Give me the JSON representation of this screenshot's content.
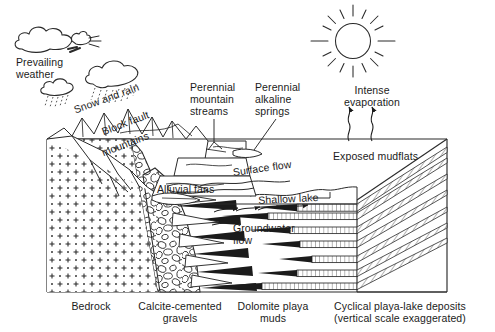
{
  "diagram": {
    "background_color": "#ffffff",
    "ink_color": "#1b1b1b"
  },
  "labels": {
    "prevailing_weather": "Prevailing\nweather",
    "snow_and_rain": "Snow and rain",
    "block_fault": "Block fault",
    "mountains": "mountains",
    "perennial_mountain_streams": "Perennial\nmountain\nstreams",
    "perennial_alkaline_springs": "Perennial\nalkaline\nsprings",
    "intense_evaporation": "Intense\nevaporation",
    "exposed_mudflats": "Exposed mudflats",
    "surface_flow": "Surface flow",
    "alluvial_fans": "Alluvial fans",
    "shallow_lake": "Shallow lake",
    "groundwater_flow": "Groundwater\nflow"
  },
  "legend": [
    {
      "name": "bedrock",
      "text": "Bedrock"
    },
    {
      "name": "calcite-cemented-gravels",
      "text": "Calcite-cemented\ngravels"
    },
    {
      "name": "dolomite-playa-muds",
      "text": "Dolomite playa\nmuds"
    },
    {
      "name": "cyclical-playa-lake-deposits",
      "text": "Cyclical playa-lake deposits\n(vertical scale exaggerated)"
    }
  ],
  "icons": {
    "sun": "sun-icon",
    "cloud_left": "cloud-icon",
    "cloud_wind": "wind-blowing-icon",
    "cloud_rain_small": "rain-cloud-icon",
    "cloud_rain_large": "rain-cloud-icon",
    "evaporation_arrows": "evaporation-arrow-icon",
    "groundwater_arrows": "flow-arrow-icon"
  }
}
